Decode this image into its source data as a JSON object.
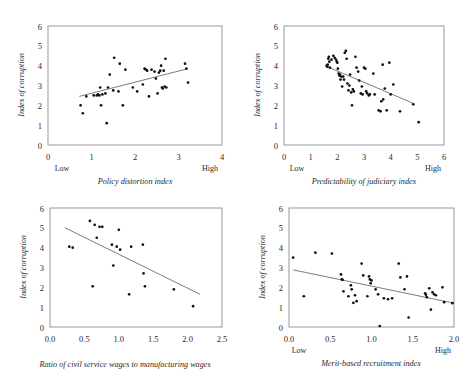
{
  "figure": {
    "top_cut_text": "",
    "shared_ylabel": "Index of corruption",
    "low_label": "Low",
    "high_label": "High"
  },
  "chart_data": [
    {
      "type": "scatter",
      "panel": "top-left",
      "title": "",
      "xlabel": "Policy distortion index",
      "ylabel": "Index of corruption",
      "xlim": [
        0,
        4
      ],
      "ylim": [
        0,
        6
      ],
      "xticks": [
        "0",
        "1",
        "2",
        "3",
        "4"
      ],
      "yticks": [
        "0",
        "1",
        "2",
        "3",
        "4",
        "5",
        "6"
      ],
      "x_low_high": [
        "Low",
        "High"
      ],
      "grid": false,
      "legend": "none",
      "trendline": {
        "x0": 0.72,
        "y0": 2.45,
        "x1": 3.22,
        "y1": 3.85
      },
      "points": [
        [
          0.75,
          2.0
        ],
        [
          0.8,
          1.6
        ],
        [
          0.88,
          2.45
        ],
        [
          1.05,
          2.5
        ],
        [
          1.12,
          2.5
        ],
        [
          1.15,
          2.55
        ],
        [
          1.18,
          2.5
        ],
        [
          1.2,
          2.9
        ],
        [
          1.22,
          2.0
        ],
        [
          1.25,
          2.55
        ],
        [
          1.32,
          2.6
        ],
        [
          1.35,
          1.1
        ],
        [
          1.38,
          2.9
        ],
        [
          1.42,
          3.55
        ],
        [
          1.5,
          2.75
        ],
        [
          1.52,
          4.4
        ],
        [
          1.62,
          2.7
        ],
        [
          1.65,
          4.1
        ],
        [
          1.72,
          2.0
        ],
        [
          1.78,
          3.8
        ],
        [
          1.95,
          2.9
        ],
        [
          2.05,
          2.7
        ],
        [
          2.18,
          3.05
        ],
        [
          2.22,
          3.85
        ],
        [
          2.25,
          3.8
        ],
        [
          2.28,
          3.75
        ],
        [
          2.32,
          2.45
        ],
        [
          2.38,
          3.8
        ],
        [
          2.45,
          3.7
        ],
        [
          2.48,
          3.35
        ],
        [
          2.52,
          2.6
        ],
        [
          2.55,
          3.65
        ],
        [
          2.58,
          3.75
        ],
        [
          2.6,
          4.0
        ],
        [
          2.62,
          2.9
        ],
        [
          2.64,
          2.85
        ],
        [
          2.66,
          3.75
        ],
        [
          2.68,
          2.95
        ],
        [
          2.7,
          4.35
        ],
        [
          2.72,
          2.9
        ],
        [
          3.15,
          4.1
        ],
        [
          3.18,
          3.85
        ],
        [
          3.22,
          3.15
        ]
      ]
    },
    {
      "type": "scatter",
      "panel": "top-right",
      "title": "",
      "xlabel": "Predictability of judiciary index",
      "ylabel": "Index of corruption",
      "xlim": [
        0,
        6
      ],
      "ylim": [
        0,
        6
      ],
      "xticks": [
        "0",
        "1",
        "2",
        "3",
        "4",
        "5",
        "6"
      ],
      "yticks": [
        "0",
        "1",
        "2",
        "3",
        "4",
        "5",
        "6"
      ],
      "x_low_high": [
        "Low",
        "High"
      ],
      "grid": false,
      "legend": "none",
      "trendline": {
        "x0": 1.62,
        "y0": 3.95,
        "x1": 4.85,
        "y1": 2.1
      },
      "points": [
        [
          1.6,
          4.0
        ],
        [
          1.62,
          3.95
        ],
        [
          1.64,
          4.05
        ],
        [
          1.66,
          4.35
        ],
        [
          1.68,
          4.45
        ],
        [
          1.7,
          4.2
        ],
        [
          1.72,
          3.9
        ],
        [
          1.78,
          4.3
        ],
        [
          1.85,
          4.5
        ],
        [
          1.9,
          4.4
        ],
        [
          1.95,
          4.3
        ],
        [
          1.98,
          4.2
        ],
        [
          2.0,
          4.15
        ],
        [
          2.02,
          3.85
        ],
        [
          2.05,
          3.6
        ],
        [
          2.08,
          3.5
        ],
        [
          2.1,
          3.55
        ],
        [
          2.12,
          3.3
        ],
        [
          2.15,
          3.45
        ],
        [
          2.18,
          2.95
        ],
        [
          2.22,
          3.45
        ],
        [
          2.25,
          3.3
        ],
        [
          2.28,
          4.65
        ],
        [
          2.32,
          4.75
        ],
        [
          2.35,
          4.35
        ],
        [
          2.38,
          3.1
        ],
        [
          2.42,
          2.75
        ],
        [
          2.45,
          3.0
        ],
        [
          2.48,
          3.55
        ],
        [
          2.52,
          2.65
        ],
        [
          2.55,
          2.0
        ],
        [
          2.58,
          2.8
        ],
        [
          2.62,
          2.7
        ],
        [
          2.68,
          4.45
        ],
        [
          2.72,
          3.9
        ],
        [
          2.78,
          3.7
        ],
        [
          2.82,
          3.25
        ],
        [
          2.88,
          2.6
        ],
        [
          2.92,
          2.95
        ],
        [
          2.95,
          2.55
        ],
        [
          3.0,
          3.9
        ],
        [
          3.05,
          3.85
        ],
        [
          3.08,
          2.7
        ],
        [
          3.12,
          2.6
        ],
        [
          3.18,
          2.5
        ],
        [
          3.22,
          2.55
        ],
        [
          3.35,
          3.6
        ],
        [
          3.4,
          2.55
        ],
        [
          3.55,
          1.75
        ],
        [
          3.62,
          1.7
        ],
        [
          3.65,
          2.2
        ],
        [
          3.7,
          4.05
        ],
        [
          3.72,
          2.3
        ],
        [
          3.78,
          2.85
        ],
        [
          3.85,
          1.75
        ],
        [
          3.95,
          4.15
        ],
        [
          4.0,
          2.55
        ],
        [
          4.1,
          3.05
        ],
        [
          4.35,
          1.7
        ],
        [
          4.85,
          2.05
        ],
        [
          5.05,
          1.15
        ]
      ]
    },
    {
      "type": "scatter",
      "panel": "bottom-left",
      "title": "",
      "xlabel": "Ratio of civil service wages to manufacturing wages",
      "ylabel": "Index of corruption",
      "xlim": [
        0.0,
        2.5
      ],
      "ylim": [
        0,
        6
      ],
      "xticks": [
        "0.0",
        "0.5",
        "1.0",
        "1.5",
        "2.0",
        "2.5"
      ],
      "yticks": [
        "0",
        "1",
        "2",
        "3",
        "4",
        "5",
        "6"
      ],
      "x_low_high": [],
      "grid": false,
      "legend": "none",
      "trendline": {
        "x0": 0.22,
        "y0": 5.0,
        "x1": 2.18,
        "y1": 1.65
      },
      "points": [
        [
          0.28,
          4.05
        ],
        [
          0.33,
          4.0
        ],
        [
          0.58,
          5.35
        ],
        [
          0.62,
          2.05
        ],
        [
          0.65,
          5.15
        ],
        [
          0.68,
          4.5
        ],
        [
          0.72,
          5.05
        ],
        [
          0.76,
          5.05
        ],
        [
          0.9,
          4.15
        ],
        [
          0.92,
          3.1
        ],
        [
          0.97,
          4.05
        ],
        [
          1.0,
          4.9
        ],
        [
          1.02,
          3.9
        ],
        [
          1.15,
          1.65
        ],
        [
          1.18,
          4.05
        ],
        [
          1.35,
          4.15
        ],
        [
          1.38,
          2.05
        ],
        [
          1.36,
          2.7
        ],
        [
          1.8,
          1.9
        ],
        [
          2.08,
          1.05
        ]
      ]
    },
    {
      "type": "scatter",
      "panel": "bottom-right",
      "title": "",
      "xlabel": "Merit-based recruitment index",
      "ylabel": "Index of corruption",
      "xlim": [
        0.0,
        2.0
      ],
      "ylim": [
        0,
        6
      ],
      "xticks": [
        "0.0",
        "0.5",
        "1.0",
        "1.5",
        "2.0"
      ],
      "yticks": [
        "0",
        "1",
        "2",
        "3",
        "4",
        "5",
        "6"
      ],
      "x_low_high": [
        "Low",
        "High"
      ],
      "grid": false,
      "legend": "none",
      "trendline": {
        "x0": 0.05,
        "y0": 2.88,
        "x1": 2.0,
        "y1": 1.2
      },
      "points": [
        [
          0.05,
          3.5
        ],
        [
          0.18,
          1.55
        ],
        [
          0.32,
          3.75
        ],
        [
          0.52,
          3.7
        ],
        [
          0.63,
          2.65
        ],
        [
          0.64,
          2.4
        ],
        [
          0.65,
          2.38
        ],
        [
          0.66,
          1.8
        ],
        [
          0.72,
          1.55
        ],
        [
          0.75,
          2.1
        ],
        [
          0.76,
          1.9
        ],
        [
          0.78,
          1.22
        ],
        [
          0.8,
          1.6
        ],
        [
          0.82,
          1.3
        ],
        [
          0.88,
          3.2
        ],
        [
          0.9,
          2.6
        ],
        [
          0.95,
          1.55
        ],
        [
          0.97,
          2.55
        ],
        [
          0.98,
          2.4
        ],
        [
          0.99,
          2.2
        ],
        [
          1.0,
          2.35
        ],
        [
          1.05,
          1.9
        ],
        [
          1.08,
          1.65
        ],
        [
          1.1,
          0.05
        ],
        [
          1.15,
          1.45
        ],
        [
          1.2,
          1.4
        ],
        [
          1.25,
          1.45
        ],
        [
          1.33,
          3.2
        ],
        [
          1.35,
          2.5
        ],
        [
          1.4,
          1.9
        ],
        [
          1.43,
          2.55
        ],
        [
          1.45,
          0.48
        ],
        [
          1.65,
          1.7
        ],
        [
          1.66,
          1.62
        ],
        [
          1.67,
          1.5
        ],
        [
          1.7,
          1.95
        ],
        [
          1.72,
          0.88
        ],
        [
          1.74,
          1.75
        ],
        [
          1.76,
          1.65
        ],
        [
          1.78,
          1.6
        ],
        [
          1.86,
          2.0
        ],
        [
          1.88,
          1.25
        ],
        [
          1.98,
          1.2
        ]
      ]
    }
  ]
}
